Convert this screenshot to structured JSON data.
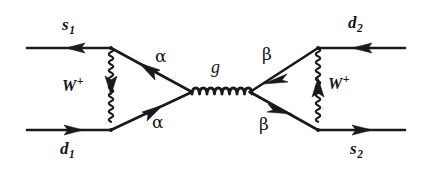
{
  "figure": {
    "kind": "feynman-diagram",
    "background_color": "#ffffff",
    "ink_color": "#1a1a1a",
    "width": 432,
    "height": 179
  },
  "labels": {
    "external": [
      {
        "id": "s1",
        "base": "s",
        "sub": "1",
        "text": "s1",
        "x": 62,
        "y": 16,
        "kind": "fermion-outgoing"
      },
      {
        "id": "d1",
        "base": "d",
        "sub": "1",
        "text": "d1",
        "x": 60,
        "y": 140,
        "kind": "fermion-incoming"
      },
      {
        "id": "d2",
        "base": "d",
        "sub": "2",
        "text": "d2",
        "x": 348,
        "y": 14,
        "kind": "fermion-outgoing"
      },
      {
        "id": "s2",
        "base": "s",
        "sub": "2",
        "text": "s2",
        "x": 350,
        "y": 140,
        "kind": "fermion-incoming"
      }
    ],
    "bosons": [
      {
        "id": "w-left",
        "base": "W",
        "sup": "+",
        "text": "W+",
        "x": 62,
        "y": 78
      },
      {
        "id": "w-right",
        "base": "W",
        "sup": "+",
        "text": "W+",
        "x": 328,
        "y": 76
      }
    ],
    "quark_flavors": [
      {
        "id": "alpha-top",
        "text": "α",
        "x": 155,
        "y": 48
      },
      {
        "id": "alpha-bottom",
        "text": "α",
        "x": 152,
        "y": 114
      },
      {
        "id": "beta-top",
        "text": "β",
        "x": 262,
        "y": 46
      },
      {
        "id": "beta-bottom",
        "text": "β",
        "x": 259,
        "y": 116
      }
    ],
    "gluon": {
      "id": "gluon-label",
      "text": "g",
      "x": 211,
      "y": 58
    }
  },
  "geometry": {
    "vertices": [
      {
        "id": "v-top-left",
        "x": 111,
        "y": 48
      },
      {
        "id": "v-bottom-left",
        "x": 111,
        "y": 130
      },
      {
        "id": "v-gluon-left",
        "x": 192,
        "y": 92
      },
      {
        "id": "v-gluon-right",
        "x": 250,
        "y": 92
      },
      {
        "id": "v-top-right",
        "x": 318,
        "y": 48
      },
      {
        "id": "v-bottom-right",
        "x": 318,
        "y": 130
      }
    ],
    "external_legs": [
      {
        "id": "leg-s1",
        "x1": 27,
        "y1": 48,
        "x2": 111,
        "y2": 48,
        "arrow_at": 0.56,
        "arrow_dir": "left"
      },
      {
        "id": "leg-d1",
        "x1": 27,
        "y1": 130,
        "x2": 111,
        "y2": 130,
        "arrow_at": 0.56,
        "arrow_dir": "right"
      },
      {
        "id": "leg-d2",
        "x1": 318,
        "y1": 48,
        "x2": 405,
        "y2": 48,
        "arrow_at": 0.45,
        "arrow_dir": "left"
      },
      {
        "id": "leg-s2",
        "x1": 318,
        "y1": 130,
        "x2": 405,
        "y2": 130,
        "arrow_at": 0.45,
        "arrow_dir": "right"
      }
    ],
    "internal_quark_legs": [
      {
        "id": "quark-alpha-top",
        "x1": 111,
        "y1": 48,
        "x2": 192,
        "y2": 92,
        "arrow_at": 0.55,
        "arrow_dir": "toward-start"
      },
      {
        "id": "quark-alpha-bottom",
        "x1": 111,
        "y1": 130,
        "x2": 192,
        "y2": 92,
        "arrow_at": 0.58,
        "arrow_dir": "toward-end"
      },
      {
        "id": "quark-beta-top",
        "x1": 318,
        "y1": 48,
        "x2": 250,
        "y2": 92,
        "arrow_at": 0.52,
        "arrow_dir": "toward-end"
      },
      {
        "id": "quark-beta-bottom",
        "x1": 318,
        "y1": 130,
        "x2": 250,
        "y2": 92,
        "arrow_at": 0.55,
        "arrow_dir": "toward-end"
      }
    ],
    "boson_propagators": [
      {
        "id": "w-prop-left",
        "x": 111,
        "y1": 48,
        "y2": 130,
        "arrow_at_y": 88,
        "arrow_dir": "down",
        "wave_amplitude": 4.2,
        "wave_period": 8.2
      },
      {
        "id": "w-prop-right",
        "x": 318,
        "y1": 48,
        "y2": 130,
        "arrow_at_y": 90,
        "arrow_dir": "up",
        "wave_amplitude": 4.2,
        "wave_period": 8.2
      }
    ],
    "gluon_propagator": {
      "id": "gluon-prop",
      "x1": 192,
      "y1": 92,
      "x2": 250,
      "y2": 92,
      "loops": 9,
      "loop_radius": 5.2
    }
  }
}
